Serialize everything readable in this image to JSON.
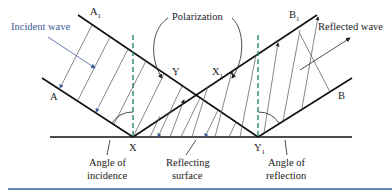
{
  "diagram": {
    "labels": {
      "incident_wave": "Incident wave",
      "reflected_wave": "Reflected wave",
      "polarization": "Polarization",
      "A": "A",
      "A1": "A",
      "A1_sub": "1",
      "B": "B",
      "B1": "B",
      "B1_sub": "1",
      "X": "X",
      "X1": "X",
      "X1_sub": "1",
      "Y": "Y",
      "Y1": "Y",
      "Y1_sub": "1",
      "angle_incidence_line1": "Angle of",
      "angle_incidence_line2": "incidence",
      "reflecting_surface_line1": "Reflecting",
      "reflecting_surface_line2": "surface",
      "angle_reflection_line1": "Angle of",
      "angle_reflection_line2": "reflection"
    },
    "colors": {
      "wavefront": "#111111",
      "normal_dashed": "#2e8b57",
      "ray_blue": "#3a5a9a",
      "ray_dark": "#333333",
      "bottom_rule": "#3a5f9e"
    }
  }
}
